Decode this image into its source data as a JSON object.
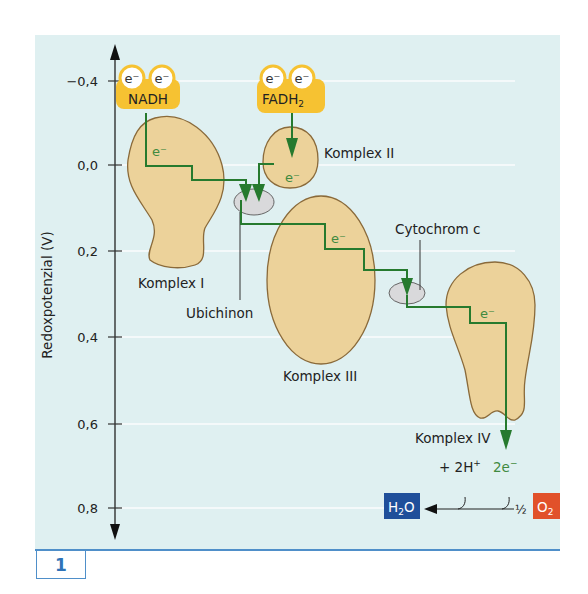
{
  "figure": {
    "number_label": "1",
    "y_axis_label": "Redoxpotenzial (V)",
    "y_ticks": [
      "−0,4",
      "0,0",
      "0,2",
      "0,4",
      "0,6",
      "0,8"
    ],
    "colors": {
      "panel_bg": "#dff0f1",
      "complex_fill": "#ecd29a",
      "complex_stroke": "#8a6a3a",
      "carrier_fill": "#f6c232",
      "electron_path": "#267a2e",
      "quinone_fill": "#d9d9db",
      "h2o_box": "#1f4f9a",
      "o2_box": "#e1512a",
      "accent_blue": "#4f8fc9"
    }
  },
  "carriers": {
    "nadh": {
      "label": "NADH",
      "electrons": [
        "e⁻",
        "e⁻"
      ]
    },
    "fadh2": {
      "label": "FADH",
      "subscript": "2",
      "electrons": [
        "e⁻",
        "e⁻"
      ]
    }
  },
  "complexes": {
    "k1": {
      "label": "Komplex I",
      "electron": "e⁻"
    },
    "k2": {
      "label": "Komplex II",
      "electron": "e⁻"
    },
    "k3": {
      "label": "Komplex III",
      "electron": "e⁻"
    },
    "k4": {
      "label": "Komplex IV",
      "electron": "e⁻"
    }
  },
  "mobile_carriers": {
    "ubichinon": "Ubichinon",
    "cytochrom_c": "Cytochrom c"
  },
  "reaction": {
    "protons": "+ 2H",
    "protons_sup": "+",
    "electrons": "2e",
    "electrons_sup": "−",
    "half": "½",
    "h2o_main": "H",
    "h2o_sub": "2",
    "h2o_end": "O",
    "o2_main": "O",
    "o2_sub": "2"
  }
}
